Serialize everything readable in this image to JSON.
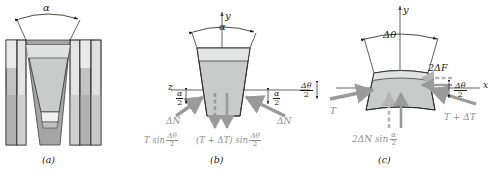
{
  "figure": {
    "type": "engineering-diagram",
    "panels": [
      {
        "id": "a",
        "caption": "(a)",
        "description": "V-belt seated in sheave groove, cross-section",
        "labels": [
          {
            "name": "groove-angle",
            "text": "α"
          }
        ]
      },
      {
        "id": "b",
        "caption": "(b)",
        "description": "Free body diagram of belt element, end view",
        "labels": [
          {
            "name": "y-axis",
            "text": "y"
          },
          {
            "name": "z-axis",
            "text": "z"
          },
          {
            "name": "groove-angle",
            "text": "α"
          },
          {
            "name": "half-angle-left",
            "num": "α",
            "den": "2"
          },
          {
            "name": "half-angle-right",
            "num": "α",
            "den": "2"
          },
          {
            "name": "normal-force-left",
            "text": "ΔN"
          },
          {
            "name": "normal-force-right",
            "text": "ΔN"
          },
          {
            "name": "tension-component-left-pre",
            "text": "T sin"
          },
          {
            "name": "tension-component-left-frac-num",
            "text": "Δθ"
          },
          {
            "name": "tension-component-left-frac-den",
            "text": "2"
          },
          {
            "name": "tension-component-right-pre",
            "text": "(T + ΔT) sin"
          },
          {
            "name": "tension-component-right-frac-num",
            "text": "Δθ"
          },
          {
            "name": "tension-component-right-frac-den",
            "text": "2"
          }
        ]
      },
      {
        "id": "c",
        "caption": "(c)",
        "description": "Free body diagram of belt element, top view with resultant forces",
        "labels": [
          {
            "name": "y-axis",
            "text": "y"
          },
          {
            "name": "x-axis",
            "text": "x"
          },
          {
            "name": "wrap-angle",
            "text": "Δθ"
          },
          {
            "name": "half-wrap-angle-left-num",
            "text": "Δθ"
          },
          {
            "name": "half-wrap-angle-left-den",
            "text": "2"
          },
          {
            "name": "half-wrap-angle-right-num",
            "text": "Δθ"
          },
          {
            "name": "half-wrap-angle-right-den",
            "text": "2"
          },
          {
            "name": "friction-force",
            "text": "2ΔF"
          },
          {
            "name": "tension-left",
            "text": "T"
          },
          {
            "name": "tension-right",
            "text": "T + ΔT"
          },
          {
            "name": "normal-resultant-pre",
            "text": "2ΔN sin"
          },
          {
            "name": "normal-resultant-frac-num",
            "text": "α"
          },
          {
            "name": "normal-resultant-frac-den",
            "text": "2"
          }
        ]
      }
    ],
    "colors": {
      "line": "#1a1a1a",
      "arrow_grey": "#9a9a9a",
      "belt_fill": "#c9cbca",
      "belt_fill_light": "#dcdedd",
      "sheave_dark": "#a8a8a8",
      "sheave_mid": "#c2c2c2",
      "sheave_light": "#e8e8e8",
      "axis": "#3a3a3a"
    }
  }
}
